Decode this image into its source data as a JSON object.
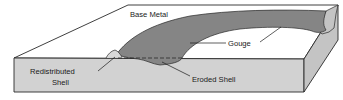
{
  "diagram": {
    "colors": {
      "top_surface": "#ffffff",
      "front_face": "#d2d2d2",
      "side_face": "#c4c4c4",
      "gouge": "#858585",
      "outline": "#2a2a2a"
    },
    "labels": {
      "base_metal": "Base Metal",
      "gouge": "Gouge",
      "redistributed_line1": "Redistributed",
      "redistributed_line2": "Shell",
      "eroded_shell": "Eroded Shell"
    }
  }
}
